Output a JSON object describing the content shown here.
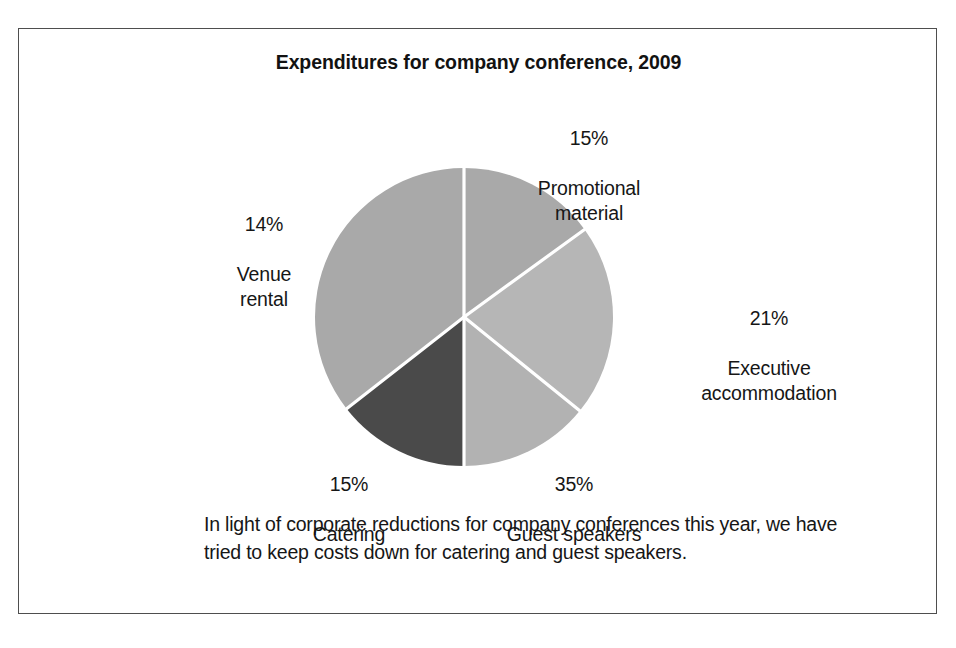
{
  "figure": {
    "title": "Expenditures for company conference, 2009",
    "caption": "In light of corporate reductions for company conferences this year, we have tried to keep costs down for catering and guest speakers.",
    "frame_color": "#4e4e4e",
    "background": "#ffffff",
    "text_color": "#161616"
  },
  "chart_data": {
    "type": "pie",
    "title": "Expenditures for company conference, 2009",
    "xlabel": "",
    "ylabel": "",
    "legend": "none",
    "grid": false,
    "unit": "%",
    "categories": [
      "Promotional material",
      "Executive accommodation",
      "Guest speakers",
      "Catering",
      "Venue rental"
    ],
    "values": [
      15,
      21,
      35,
      15,
      14
    ],
    "labels": [
      "15%\nPromotional\nmaterial",
      "21%\nExecutive\naccommodation",
      "35%\nGuest speakers",
      "15%\nCatering",
      "14%\nVenue\nrental"
    ],
    "slices": [
      {
        "name": "Promotional material",
        "label_pct": "15%",
        "label_name": "Promotional\nmaterial",
        "value": 15,
        "color": "#a9a9a9",
        "start_angle_deg": 0,
        "end_angle_deg": 54
      },
      {
        "name": "Executive accommodation",
        "label_pct": "21%",
        "label_name": "Executive\naccommodation",
        "value": 21,
        "color": "#b6b6b6",
        "start_angle_deg": 54,
        "end_angle_deg": 129
      },
      {
        "name": "Guest speakers",
        "label_pct": "35%",
        "label_name": "Guest speakers",
        "value": 35,
        "color": "#b2b2b2",
        "start_angle_deg": 129,
        "end_angle_deg": 180
      },
      {
        "name": "Catering",
        "label_pct": "15%",
        "label_name": "Catering",
        "value": 15,
        "color": "#4a4a4a",
        "start_angle_deg": 180,
        "end_angle_deg": 232
      },
      {
        "name": "Venue rental",
        "label_pct": "14%",
        "label_name": "Venue\nrental",
        "value": 14,
        "color": "#a9a9a9",
        "start_angle_deg": 232,
        "end_angle_deg": 360
      }
    ],
    "separator_color": "#ffffff"
  }
}
